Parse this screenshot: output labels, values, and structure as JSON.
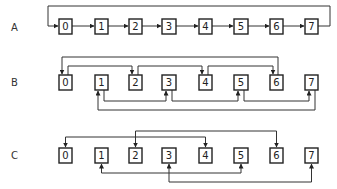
{
  "diagram": {
    "rows": [
      {
        "label": "A",
        "nodes": [
          "0",
          "1",
          "2",
          "3",
          "4",
          "5",
          "6",
          "7"
        ],
        "connections": [
          {
            "from": "0",
            "to": "1"
          },
          {
            "from": "1",
            "to": "2"
          },
          {
            "from": "2",
            "to": "3"
          },
          {
            "from": "3",
            "to": "4"
          },
          {
            "from": "4",
            "to": "5"
          },
          {
            "from": "5",
            "to": "6"
          },
          {
            "from": "6",
            "to": "7"
          },
          {
            "from": "7",
            "to": "0",
            "route": "loop-over-top"
          }
        ]
      },
      {
        "label": "B",
        "nodes": [
          "0",
          "1",
          "2",
          "3",
          "4",
          "5",
          "6",
          "7"
        ],
        "connections": [
          {
            "from": "0",
            "to": "2",
            "route": "above"
          },
          {
            "from": "2",
            "to": "4",
            "route": "above"
          },
          {
            "from": "4",
            "to": "6",
            "route": "above"
          },
          {
            "from": "6",
            "to": "0",
            "route": "above-outer"
          },
          {
            "from": "1",
            "to": "3",
            "route": "below"
          },
          {
            "from": "3",
            "to": "5",
            "route": "below"
          },
          {
            "from": "5",
            "to": "7",
            "route": "below"
          },
          {
            "from": "7",
            "to": "1",
            "route": "below-outer"
          }
        ]
      },
      {
        "label": "C",
        "nodes": [
          "0",
          "1",
          "2",
          "3",
          "4",
          "5",
          "6",
          "7"
        ],
        "connections": [
          {
            "from": "0",
            "to": "4",
            "route": "above",
            "bidirectional": true
          },
          {
            "from": "2",
            "to": "6",
            "route": "above-outer",
            "bidirectional": true
          },
          {
            "from": "1",
            "to": "5",
            "route": "below",
            "bidirectional": true
          },
          {
            "from": "3",
            "to": "7",
            "route": "below-outer",
            "bidirectional": true
          }
        ]
      }
    ]
  }
}
